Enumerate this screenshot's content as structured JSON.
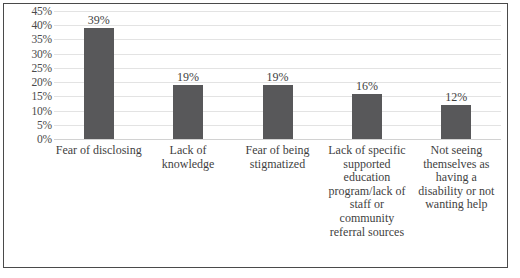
{
  "chart_data": {
    "type": "bar",
    "title": "",
    "subtitle": "",
    "xlabel": "",
    "ylabel": "",
    "ylim": [
      0,
      45
    ],
    "grid": true,
    "legend": false,
    "legend_position": "none",
    "bar_color": "#58585a",
    "gridline_color": "#e3e3e3",
    "border_color": "#4a4a4a",
    "ytick_labels": [
      "45%",
      "40%",
      "35%",
      "30%",
      "25%",
      "20%",
      "15%",
      "10%",
      "5%",
      "0%"
    ],
    "ytick_values": [
      45,
      40,
      35,
      30,
      25,
      20,
      15,
      10,
      5,
      0
    ],
    "categories": [
      "Fear of disclosing",
      "Lack of knowledge",
      "Fear of being stigmatized",
      "Lack of specific supported education program/lack of staff or community referral sources",
      "Not seeing themselves as having a disability or not wanting help"
    ],
    "values": [
      39,
      19,
      19,
      16,
      12
    ],
    "data_labels": [
      "39%",
      "19%",
      "19%",
      "16%",
      "12%"
    ]
  }
}
